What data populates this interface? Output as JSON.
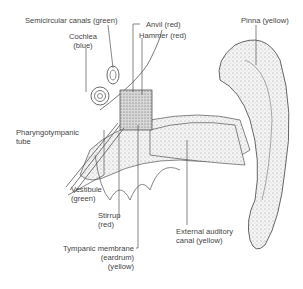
{
  "diagram": {
    "labels": [
      {
        "id": "semicircular",
        "lines": [
          "Semicircular canals (green)"
        ]
      },
      {
        "id": "cochlea",
        "lines": [
          "Cochlea",
          "(blue)"
        ]
      },
      {
        "id": "anvil",
        "lines": [
          "Anvil (red)"
        ]
      },
      {
        "id": "hammer",
        "lines": [
          "Hammer (red)"
        ]
      },
      {
        "id": "pinna",
        "lines": [
          "Pinna (yellow)"
        ]
      },
      {
        "id": "pharyngo",
        "lines": [
          "Pharyngotympanic",
          "tube"
        ]
      },
      {
        "id": "vestibule",
        "lines": [
          "Vestibule",
          "(green)"
        ]
      },
      {
        "id": "stirrup",
        "lines": [
          "Stirrup",
          "(red)"
        ]
      },
      {
        "id": "tympanic",
        "lines": [
          "Tympanic membrane",
          "(eardrum)",
          "(yellow)"
        ]
      },
      {
        "id": "external",
        "lines": [
          "External auditory",
          "canal (yellow)"
        ]
      }
    ]
  }
}
